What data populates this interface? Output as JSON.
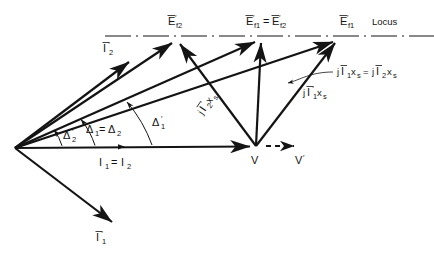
{
  "figure": {
    "kind": "phasor-diagram",
    "ink_color": "#141414",
    "background": "#ffffff"
  },
  "labels": {
    "e_f2_prime": {
      "base": "E",
      "sub": "f2",
      "prime": true,
      "bar": true,
      "text": "E̅′f2",
      "x": 178,
      "y": 22
    },
    "e_f1_eq_e_f2_prime": {
      "text": "E̅′f1=E̅′f2",
      "x": 272,
      "y": 22
    },
    "e_f1": {
      "text": "E̅f1",
      "x": 348,
      "y": 22
    },
    "locus": {
      "text": "Locus",
      "x": 396,
      "y": 23
    },
    "i2_prime": {
      "text": "I̅′2",
      "x": 110,
      "y": 52
    },
    "i1_prime": {
      "text": "I̅′1",
      "x": 103,
      "y": 240
    },
    "jx_equal": {
      "text": "jI̅1xs = jI̅2xs",
      "x": 340,
      "y": 74
    },
    "jx_prime_1": {
      "text": "jI̅′1xs",
      "x": 306,
      "y": 95
    },
    "jx_prime_2": {
      "text": "jI̅′2xs",
      "x": 205,
      "y": 112,
      "rotate": -58
    },
    "delta_1_eq_delta_2": {
      "text": "Δ₁=Δ₂",
      "x": 101,
      "y": 131
    },
    "delta_2_prime": {
      "text": "Δ′₂",
      "x": 69,
      "y": 137
    },
    "delta_1_prime": {
      "text": "Δ′₁",
      "x": 158,
      "y": 124
    },
    "i1_eq_i2": {
      "text": "I₁ = I₂",
      "x": 120,
      "y": 165
    },
    "v": {
      "text": "V",
      "x": 254,
      "y": 163
    },
    "v_prime": {
      "text": "V′",
      "x": 299,
      "y": 163
    }
  },
  "label_parts": {
    "e_f2_prime": {
      "main": "E",
      "sub": "f2"
    },
    "e_f1_prime_a": {
      "main": "E",
      "sub": "f1"
    },
    "e_f2_prime_b": {
      "main": "E",
      "sub": "f2"
    },
    "e_f1": {
      "main": "E",
      "sub": "f1"
    },
    "equals": "=",
    "locus": "Locus",
    "i_main": "I",
    "sub_1": "1",
    "sub_2": "2",
    "j": "j",
    "x_s": "x",
    "sub_s": "s",
    "delta": "Δ",
    "v": "V"
  },
  "geometry": {
    "origin": {
      "x": 15,
      "y": 148
    },
    "v_point": {
      "x": 256,
      "y": 146
    },
    "locus_line": {
      "x1": 105,
      "y1": 36,
      "x2": 434,
      "y2": 36
    },
    "tip_ef2_prime": {
      "x": 178,
      "y": 38
    },
    "tip_ef1_ef2_prime": {
      "x": 262,
      "y": 37
    },
    "tip_ef1": {
      "x": 340,
      "y": 37
    },
    "tip_i2_prime": {
      "x": 128,
      "y": 60
    },
    "tip_i1_prime": {
      "x": 112,
      "y": 225
    },
    "v_prime_arrow": {
      "x1": 266,
      "y1": 146,
      "x2": 300,
      "y2": 146
    },
    "axis_arrow": {
      "x1": 15,
      "y1": 148,
      "x2": 258,
      "y2": 147
    }
  },
  "angles": {
    "delta_1_deg": 24,
    "delta_2_deg": 24,
    "delta_1_prime_deg": 32,
    "delta_2_prime_deg": 14
  }
}
